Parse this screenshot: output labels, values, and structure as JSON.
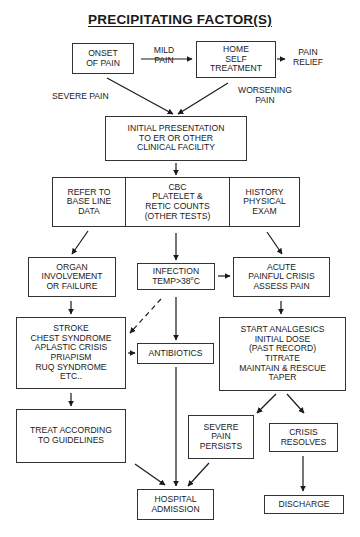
{
  "title": "PRECIPITATING FACTOR(S)",
  "nodes": {
    "onset": "ONSET\nOF PAIN",
    "home": "HOME\nSELF\nTREATMENT",
    "initial": "INITIAL PRESENTATION\nTO ER OR OTHER\nCLINICAL FACILITY",
    "refer": "REFER TO\nBASE LINE\nDATA",
    "cbc": "CBC\nPLATELET &\nRETIC COUNTS\n(OTHER TESTS)",
    "history": "HISTORY\nPHYSICAL\nEXAM",
    "organ": "ORGAN\nINVOLVEMENT\nOR FAILURE",
    "infection_line1": "INFECTION",
    "infection_line2_prefix": "TEMP>38",
    "infection_degree": "o",
    "infection_unit": "C",
    "acute": "ACUTE\nPAINFUL CRISIS\nASSESS PAIN",
    "stroke": "STROKE\nCHEST SYNDROME\nAPLASTIC CRISIS\nPRIAPISM\nRUQ SYNDROME\nETC..",
    "antibiotics": "ANTIBIOTICS",
    "start": "START ANALGESICS\nINITIAL DOSE\n(PAST RECORD)\nTITRATE\nMAINTAIN & RESCUE\nTAPER",
    "treat": "TREAT ACCORDING\nTO GUIDELINES",
    "severe": "SEVERE\nPAIN\nPERSISTS",
    "crisis": "CRISIS\nRESOLVES",
    "hospital": "HOSPITAL\nADMISSION",
    "discharge": "DISCHARGE"
  },
  "edge_labels": {
    "mild_pain": "MILD\nPAIN",
    "pain_relief": "PAIN\nRELIEF",
    "severe_pain": "SEVERE PAIN",
    "worsening_pain": "WORSENING\nPAIN"
  }
}
